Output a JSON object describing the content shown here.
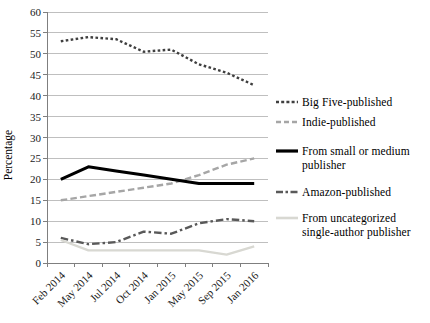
{
  "chart_data": {
    "type": "line",
    "title": "",
    "xlabel": "",
    "ylabel": "Percentage",
    "ylim": [
      0,
      60
    ],
    "ytick_step": 5,
    "y_tick_labels": [
      "0",
      "5",
      "10",
      "15",
      "20",
      "25",
      "30",
      "35",
      "40",
      "45",
      "50",
      "55",
      "60"
    ],
    "grid": true,
    "legend_position": "right",
    "categories": [
      "Feb 2014",
      "May 2014",
      "Jul 2014",
      "Oct 2014",
      "Jan 2015",
      "May 2015",
      "Sep 2015",
      "Jan 2016"
    ],
    "series": [
      {
        "name": "Big Five-published",
        "values": [
          53,
          54,
          53.5,
          50.5,
          51,
          47.5,
          45.5,
          42.5
        ],
        "color": "#3f3f3f",
        "line_style": "dotted"
      },
      {
        "name": "Indie-published",
        "values": [
          15,
          16,
          17,
          18,
          19,
          21,
          23.5,
          25
        ],
        "color": "#a6a6a6",
        "line_style": "dashed"
      },
      {
        "name": "From small or medium publisher",
        "values": [
          20,
          23,
          22,
          21,
          20,
          19,
          19,
          19
        ],
        "color": "#000000",
        "line_style": "solid-thick"
      },
      {
        "name": "Amazon-published",
        "values": [
          6,
          4.5,
          5,
          7.5,
          7,
          9.5,
          10.5,
          10
        ],
        "color": "#595959",
        "line_style": "dash-dot"
      },
      {
        "name": "From uncategorized single-author publisher",
        "values": [
          5.5,
          3,
          3,
          3,
          3,
          3,
          2,
          4
        ],
        "color": "#d8d8d2",
        "line_style": "solid"
      }
    ],
    "axis_color": "#7f7f7f",
    "gridline_color": "#bfbfbf",
    "tick_label_color": "#1a1a1a"
  }
}
